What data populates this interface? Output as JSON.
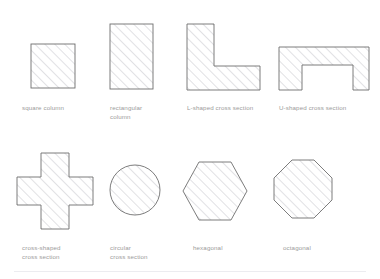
{
  "figure": {
    "background_color": "#ffffff",
    "outline_color": "#6e6e6e",
    "hatch_color": "#d8d8dc",
    "caption_color": "#9b9b9b",
    "divider_color": "#ececf0"
  },
  "rows": [
    {
      "index": 0,
      "items": [
        {
          "id": "square-column",
          "label": "square column",
          "shape": "square",
          "geometry": {
            "x": 31,
            "y": 44,
            "width": 44,
            "height": 44
          },
          "caption_pos": {
            "x": 22,
            "y": 103
          }
        },
        {
          "id": "rectangular-column",
          "label": "rectangular\ncolumn",
          "shape": "rectangle",
          "geometry": {
            "x": 110,
            "y": 24,
            "width": 43,
            "height": 65
          },
          "caption_pos": {
            "x": 110,
            "y": 103
          }
        },
        {
          "id": "l-shaped-cross-section",
          "label": "L-shaped cross section",
          "shape": "l-shape",
          "geometry": {
            "x": 187,
            "y": 24,
            "width": 73,
            "height": 66,
            "arm_thickness": 27
          },
          "caption_pos": {
            "x": 187,
            "y": 103
          }
        },
        {
          "id": "u-shaped-cross-section",
          "label": "U-shaped cross section",
          "shape": "inverted-u-shape",
          "geometry": {
            "x": 279,
            "y": 47,
            "width": 90,
            "height": 43,
            "web_thickness": 16,
            "flange_thickness": 18
          },
          "caption_pos": {
            "x": 279,
            "y": 103
          }
        }
      ]
    },
    {
      "index": 1,
      "items": [
        {
          "id": "cross-shaped-cross-section",
          "label": "cross-shaped\ncross section",
          "shape": "cross",
          "geometry": {
            "x": 17,
            "y": 153,
            "width": 76,
            "height": 76,
            "arm_thickness": 28
          },
          "caption_pos": {
            "x": 22,
            "y": 243
          }
        },
        {
          "id": "circular-cross-section",
          "label": "circular\ncross section",
          "shape": "circle",
          "geometry": {
            "cx": 135,
            "cy": 190,
            "r": 25
          },
          "caption_pos": {
            "x": 110,
            "y": 243
          }
        },
        {
          "id": "hexagonal-cross-section",
          "label": "hexagonal",
          "shape": "hexagon",
          "geometry": {
            "cx": 215,
            "cy": 191,
            "rx": 32,
            "ry": 29
          },
          "caption_pos": {
            "x": 193,
            "y": 243
          }
        },
        {
          "id": "octagonal-cross-section",
          "label": "octagonal",
          "shape": "octagon",
          "geometry": {
            "cx": 303,
            "cy": 189,
            "r": 30
          },
          "caption_pos": {
            "x": 283,
            "y": 243
          }
        }
      ]
    }
  ]
}
